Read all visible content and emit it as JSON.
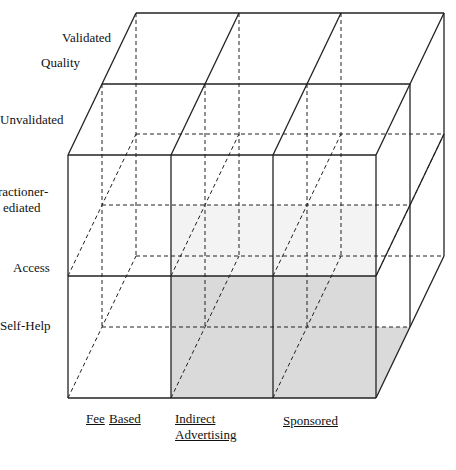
{
  "diagram": {
    "type": "3d-cube-matrix",
    "axes": {
      "quality": {
        "title": "Quality",
        "levels": [
          "Validated",
          "Unvalidated"
        ]
      },
      "access": {
        "title": "Access",
        "levels": [
          "Practitioner-Mediated",
          "Self-Help"
        ],
        "visible_fragment": [
          "ractioner-",
          "ediated"
        ]
      },
      "funding": {
        "levels": [
          "Fee",
          "Based",
          "Indirect",
          "Advertising",
          "Sponsored"
        ]
      }
    },
    "labels": {
      "validated": "Validated",
      "quality": "Quality",
      "unvalidated": "Unvalidated",
      "practitioner_line1": "ractioner-",
      "practitioner_line2": "ediated",
      "access": "Access",
      "self_help": "Self-Help",
      "fee": "Fee",
      "based": "Based",
      "indirect": "Indirect",
      "advertising": "Advertising",
      "sponsored": "Sponsored"
    },
    "colors": {
      "line": "#222222",
      "shade": "#d9d9d9"
    },
    "highlighted_cells": [
      "Self-Help x Indirect Advertising",
      "Self-Help x Sponsored"
    ]
  }
}
